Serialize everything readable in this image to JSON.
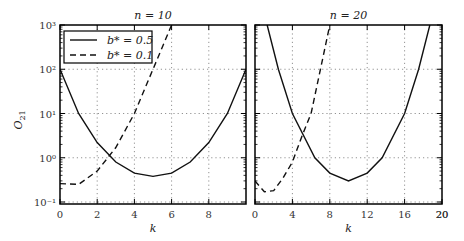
{
  "chart_data": [
    {
      "type": "line",
      "title": "n = 10",
      "xlabel": "k",
      "ylabel": "O21",
      "yscale": "log",
      "xlim": [
        0,
        10
      ],
      "ylim": [
        0.09,
        1000
      ],
      "xticks": [
        0,
        2,
        4,
        6,
        8
      ],
      "yticks": [
        "10^-1",
        "10^0",
        "10^1",
        "10^2",
        "10^3"
      ],
      "grid": true,
      "legend": {
        "position": "upper left",
        "entries": [
          "b* = 0.5",
          "b* = 0.1"
        ]
      },
      "series": [
        {
          "name": "b* = 0.5",
          "style": "solid",
          "x": [
            0,
            1,
            2,
            3,
            4,
            5,
            6,
            7,
            8,
            9,
            10
          ],
          "y": [
            100,
            10,
            2.2,
            0.8,
            0.45,
            0.38,
            0.45,
            0.8,
            2.2,
            10,
            100
          ]
        },
        {
          "name": "b* = 0.1",
          "style": "dashed",
          "x": [
            0,
            1,
            2,
            3,
            4,
            5,
            6
          ],
          "y": [
            0.26,
            0.25,
            0.5,
            1.7,
            10,
            100,
            1000
          ]
        }
      ]
    },
    {
      "type": "line",
      "title": "n = 20",
      "xlabel": "k",
      "ylabel": "",
      "yscale": "log",
      "xlim": [
        0,
        20
      ],
      "ylim": [
        0.09,
        1000
      ],
      "xticks": [
        0,
        4,
        8,
        12,
        16,
        20
      ],
      "grid": true,
      "series": [
        {
          "name": "b* = 0.5",
          "style": "solid",
          "x": [
            1.3,
            2.5,
            4,
            6.4,
            8,
            10,
            12,
            13.6,
            16,
            17.5,
            18.7
          ],
          "y": [
            1000,
            100,
            10,
            1,
            0.45,
            0.3,
            0.45,
            1,
            10,
            100,
            1000
          ]
        },
        {
          "name": "b* = 0.1",
          "style": "dashed",
          "x": [
            0,
            1,
            2,
            3,
            4,
            5,
            6,
            7,
            8
          ],
          "y": [
            0.3,
            0.17,
            0.18,
            0.35,
            0.8,
            3,
            10,
            100,
            1000
          ]
        }
      ]
    }
  ],
  "labels": {
    "title_left": "n = 10",
    "title_right": "n = 20",
    "xlabel": "k",
    "ylabel": "O",
    "ylabel_sub": "21",
    "legend_solid": "b* = 0.5",
    "legend_dashed": "b* = 0.1"
  }
}
